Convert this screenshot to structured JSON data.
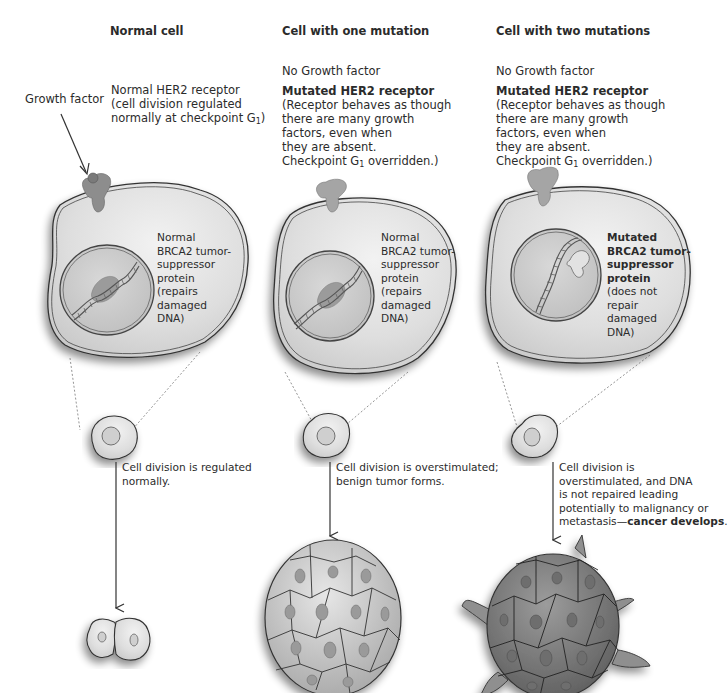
{
  "columns": [
    {
      "title": "Normal cell",
      "growth_factor_label": "Growth factor",
      "receptor_label": "Normal HER2 receptor",
      "receptor_desc": [
        "(cell division regulated",
        "normally at checkpoint G"
      ],
      "checkpoint_subscript": "1",
      "brca2_lines": [
        "Normal",
        "BRCA2 tumor-",
        "suppressor",
        "protein",
        "(repairs",
        "damaged",
        "DNA)"
      ],
      "outcome_lines": [
        "Cell division is regulated",
        "normally."
      ]
    },
    {
      "title": "Cell with one mutation",
      "growth_factor_label": "No Growth factor",
      "receptor_label": "Mutated HER2 receptor",
      "receptor_desc": [
        "(Receptor behaves as though",
        "there are many growth",
        "factors, even when",
        "they are absent.",
        "Checkpoint G"
      ],
      "checkpoint_subscript": "1",
      "checkpoint_suffix": " overridden.)",
      "brca2_lines": [
        "Normal",
        "BRCA2 tumor-",
        "suppressor",
        "protein",
        "(repairs",
        "damaged",
        "DNA)"
      ],
      "outcome_lines": [
        "Cell division is overstimulated;",
        "benign tumor forms."
      ]
    },
    {
      "title": "Cell with two mutations",
      "growth_factor_label": "No Growth factor",
      "receptor_label": "Mutated HER2 receptor",
      "receptor_desc": [
        "(Receptor behaves as though",
        "there are many growth",
        "factors, even when",
        "they are absent.",
        "Checkpoint G"
      ],
      "checkpoint_subscript": "1",
      "checkpoint_suffix": " overridden.)",
      "brca2_bold_lines": [
        "Mutated",
        "BRCA2 tumor-",
        "suppressor",
        "protein"
      ],
      "brca2_lines": [
        "(does not",
        "repair",
        "damaged",
        "DNA)"
      ],
      "outcome_lines": [
        "Cell division is",
        "overstimulated, and DNA",
        "is not repaired leading",
        "potentially to malignancy or"
      ],
      "outcome_last_plain": "metastasis—",
      "outcome_last_bold": "cancer develops",
      "outcome_last_end": "."
    }
  ],
  "colors": {
    "cell_fill": "#dcdcdc",
    "nucleus_fill": "#c9c9c9",
    "receptor_fill": "#9a9a9a",
    "tumor_benign": "#c4c4c4",
    "tumor_malignant": "#8a8a8a",
    "line": "#333333"
  }
}
